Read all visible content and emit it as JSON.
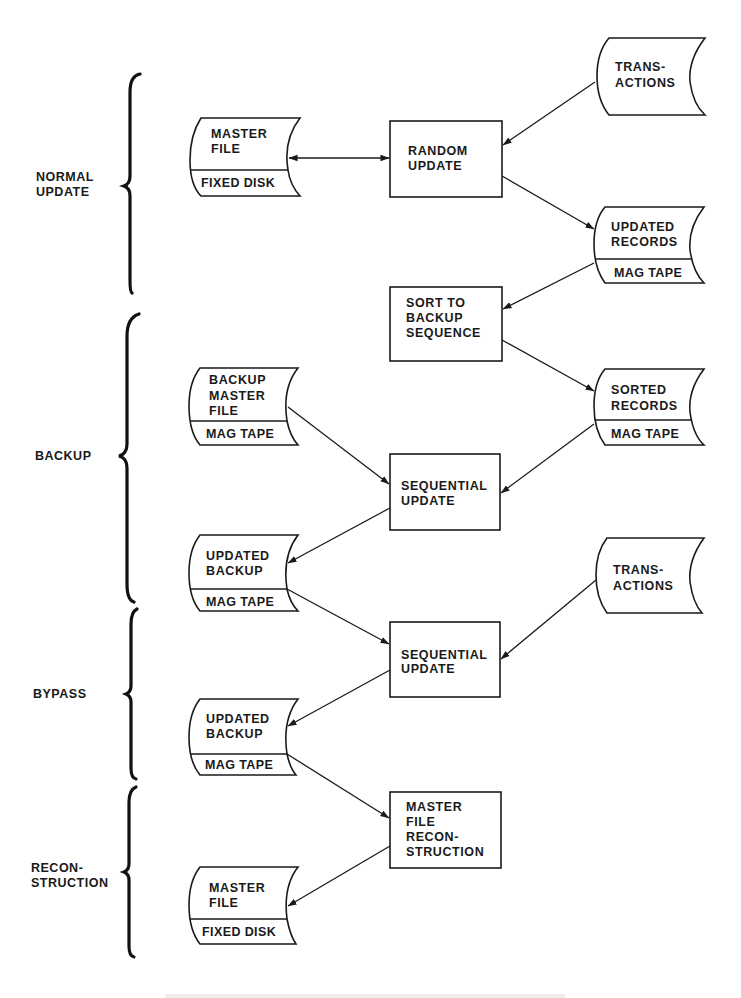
{
  "diagram": {
    "type": "flowchart",
    "sections": [
      {
        "id": "normal_update",
        "lines": [
          "NORMAL",
          "UPDATE"
        ]
      },
      {
        "id": "backup",
        "lines": [
          "BACKUP"
        ]
      },
      {
        "id": "bypass",
        "lines": [
          "BYPASS"
        ]
      },
      {
        "id": "reconstruction",
        "lines": [
          "RECON-",
          "STRUCTION"
        ]
      }
    ],
    "nodes": {
      "master_file_1": {
        "shape": "storage",
        "lines": [
          "MASTER",
          "FILE"
        ],
        "medium": "FIXED DISK"
      },
      "random_update": {
        "shape": "process",
        "lines": [
          "RANDOM",
          "UPDATE"
        ]
      },
      "transactions_1": {
        "shape": "document",
        "lines": [
          "TRANS-",
          "ACTIONS"
        ]
      },
      "updated_records": {
        "shape": "storage",
        "lines": [
          "UPDATED",
          "RECORDS"
        ],
        "medium": "MAG TAPE"
      },
      "sort_backup": {
        "shape": "process",
        "lines": [
          "SORT TO",
          "BACKUP",
          "SEQUENCE"
        ]
      },
      "backup_master_file": {
        "shape": "storage",
        "lines": [
          "BACKUP",
          "MASTER",
          "FILE"
        ],
        "medium": "MAG TAPE"
      },
      "sorted_records": {
        "shape": "storage",
        "lines": [
          "SORTED",
          "RECORDS"
        ],
        "medium": "MAG TAPE"
      },
      "sequential_update_1": {
        "shape": "process",
        "lines": [
          "SEQUENTIAL",
          "UPDATE"
        ]
      },
      "updated_backup_1": {
        "shape": "storage",
        "lines": [
          "UPDATED",
          "BACKUP"
        ],
        "medium": "MAG TAPE"
      },
      "transactions_2": {
        "shape": "document",
        "lines": [
          "TRANS-",
          "ACTIONS"
        ]
      },
      "sequential_update_2": {
        "shape": "process",
        "lines": [
          "SEQUENTIAL",
          "UPDATE"
        ]
      },
      "updated_backup_2": {
        "shape": "storage",
        "lines": [
          "UPDATED",
          "BACKUP"
        ],
        "medium": "MAG TAPE"
      },
      "master_file_reconstruction": {
        "shape": "process",
        "lines": [
          "MASTER",
          "FILE",
          "RECON-",
          "STRUCTION"
        ]
      },
      "master_file_2": {
        "shape": "storage",
        "lines": [
          "MASTER",
          "FILE"
        ],
        "medium": "FIXED DISK"
      }
    },
    "edges": [
      {
        "from": "master_file_1",
        "to": "random_update",
        "bidirectional": true
      },
      {
        "from": "transactions_1",
        "to": "random_update"
      },
      {
        "from": "random_update",
        "to": "updated_records"
      },
      {
        "from": "updated_records",
        "to": "sort_backup"
      },
      {
        "from": "sort_backup",
        "to": "sorted_records"
      },
      {
        "from": "backup_master_file",
        "to": "sequential_update_1"
      },
      {
        "from": "sorted_records",
        "to": "sequential_update_1"
      },
      {
        "from": "sequential_update_1",
        "to": "updated_backup_1"
      },
      {
        "from": "updated_backup_1",
        "to": "sequential_update_2"
      },
      {
        "from": "transactions_2",
        "to": "sequential_update_2"
      },
      {
        "from": "sequential_update_2",
        "to": "updated_backup_2"
      },
      {
        "from": "updated_backup_2",
        "to": "master_file_reconstruction"
      },
      {
        "from": "master_file_reconstruction",
        "to": "master_file_2"
      }
    ]
  }
}
